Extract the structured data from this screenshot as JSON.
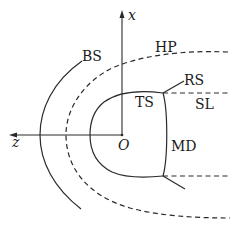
{
  "diagram": {
    "type": "heliosphere-schematic",
    "axes": {
      "vertical": {
        "label": "x"
      },
      "horizontal": {
        "label": "z"
      },
      "origin": {
        "label": "O"
      }
    },
    "labels": {
      "bow_shock": "BS",
      "heliopause": "HP",
      "reflected_shock": "RS",
      "termination_shock": "TS",
      "slip_line": "SL",
      "mach_disk": "MD"
    },
    "line_styles": {
      "BS": "solid",
      "HP": "dashed",
      "TS": "solid",
      "MD": "solid",
      "RS": "solid",
      "SL": "dashed"
    },
    "colors": {
      "stroke": "#2a2a2a",
      "text": "#1a1a1a",
      "background": "#ffffff"
    }
  }
}
